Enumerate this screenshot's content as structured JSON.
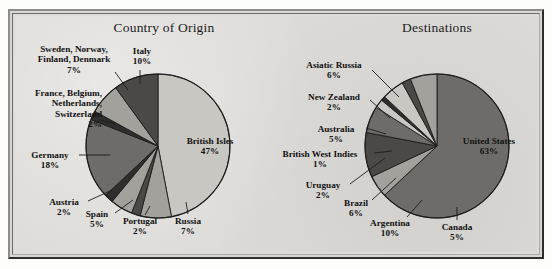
{
  "figure": {
    "background_color": "#dddbd7",
    "slice_colors": {
      "light": "#c9c7c2",
      "mid": "#a3a19c",
      "dark": "#6e6c68",
      "darker": "#4a4946",
      "darkest": "#2f2e2c",
      "outline": "#1c1c1a"
    }
  },
  "charts": [
    {
      "id": "country-of-origin",
      "title": "Country of Origin",
      "center": {
        "x": 158,
        "y": 146
      },
      "radius": 72,
      "start_angle_deg": -90,
      "slices": [
        {
          "label": "British Isles",
          "pct": 47,
          "pct_text": "47%",
          "fill": "light"
        },
        {
          "label": "Russia",
          "pct": 7,
          "pct_text": "7%",
          "fill": "mid"
        },
        {
          "label": "Portugal",
          "pct": 2,
          "pct_text": "2%",
          "fill": "darker"
        },
        {
          "label": "Spain",
          "pct": 5,
          "pct_text": "5%",
          "fill": "mid"
        },
        {
          "label": "Austria",
          "pct": 2,
          "pct_text": "2%",
          "fill": "darkest"
        },
        {
          "label": "Germany",
          "pct": 18,
          "pct_text": "18%",
          "fill": "dark"
        },
        {
          "label": "France, Belgium, Netherlands, Switzerland",
          "pct": 2,
          "pct_text": "2%",
          "fill": "darkest"
        },
        {
          "label": "Sweden, Norway, Finland, Denmark",
          "pct": 7,
          "pct_text": "7%",
          "fill": "mid"
        },
        {
          "label": "Italy",
          "pct": 10,
          "pct_text": "10%",
          "fill": "darker"
        }
      ],
      "callouts": [
        {
          "name": "sweden-norway-finland-denmark",
          "lines": [
            "Sweden, Norway,",
            "Finland, Denmark"
          ],
          "pct_text": "7%",
          "align": "center",
          "x": 22,
          "y": 44,
          "w": 104,
          "leader": [
            [
              115,
              72
            ],
            [
              128,
              90
            ]
          ]
        },
        {
          "name": "italy",
          "lines": [
            "Italy"
          ],
          "pct_text": "10%",
          "align": "center",
          "x": 122,
          "y": 46,
          "w": 40,
          "leader": [
            [
              140,
              70
            ],
            [
              140,
              84
            ]
          ]
        },
        {
          "name": "france-belgium-netherlands-switzerland",
          "lines": [
            "France, Belgium,",
            "Netherlands,",
            "Switzerland"
          ],
          "pct_text": "2%",
          "align": "right",
          "x": 10,
          "y": 88,
          "w": 92,
          "leader": [
            [
              101,
              120
            ],
            [
              116,
              124
            ]
          ]
        },
        {
          "name": "germany",
          "lines": [
            "Germany"
          ],
          "pct_text": "18%",
          "align": "center",
          "x": 22,
          "y": 150,
          "w": 56,
          "leader": [
            [
              79,
              155
            ],
            [
              110,
              155
            ]
          ]
        },
        {
          "name": "austria",
          "lines": [
            "Austria"
          ],
          "pct_text": "2%",
          "align": "center",
          "x": 42,
          "y": 197,
          "w": 44,
          "leader": [
            [
              88,
              201
            ],
            [
              112,
              190
            ]
          ]
        },
        {
          "name": "spain",
          "lines": [
            "Spain"
          ],
          "pct_text": "5%",
          "align": "center",
          "x": 78,
          "y": 209,
          "w": 38,
          "leader": [
            [
              115,
              213
            ],
            [
              133,
              200
            ]
          ]
        },
        {
          "name": "portugal",
          "lines": [
            "Portugal"
          ],
          "pct_text": "2%",
          "align": "center",
          "x": 115,
          "y": 216,
          "w": 50,
          "leader": [
            [
              145,
              215
            ],
            [
              150,
              206
            ]
          ]
        },
        {
          "name": "russia",
          "lines": [
            "Russia"
          ],
          "pct_text": "7%",
          "align": "center",
          "x": 166,
          "y": 216,
          "w": 44,
          "leader": [
            [
              188,
              214
            ],
            [
              186,
              202
            ]
          ]
        }
      ]
    },
    {
      "id": "destinations",
      "title": "Destinations",
      "center": {
        "x": 437,
        "y": 146
      },
      "radius": 72,
      "start_angle_deg": -90,
      "slices": [
        {
          "label": "United States",
          "pct": 63,
          "pct_text": "63%",
          "fill": "dark"
        },
        {
          "label": "Canada",
          "pct": 5,
          "pct_text": "5%",
          "fill": "mid"
        },
        {
          "label": "Argentina",
          "pct": 10,
          "pct_text": "10%",
          "fill": "darker"
        },
        {
          "label": "Brazil",
          "pct": 6,
          "pct_text": "6%",
          "fill": "dark"
        },
        {
          "label": "Uruguay",
          "pct": 2,
          "pct_text": "2%",
          "fill": "light"
        },
        {
          "label": "British West Indies",
          "pct": 1,
          "pct_text": "1%",
          "fill": "darkest"
        },
        {
          "label": "Australia",
          "pct": 5,
          "pct_text": "5%",
          "fill": "light"
        },
        {
          "label": "New Zealand",
          "pct": 2,
          "pct_text": "2%",
          "fill": "darker"
        },
        {
          "label": "Asiatic Russia",
          "pct": 6,
          "pct_text": "6%",
          "fill": "mid"
        }
      ],
      "callouts": [
        {
          "name": "asiatic-russia",
          "lines": [
            "Asiatic Russia"
          ],
          "pct_text": "6%",
          "align": "center",
          "x": 292,
          "y": 60,
          "w": 84,
          "leader": [
            [
              372,
              70
            ],
            [
              399,
              97
            ]
          ]
        },
        {
          "name": "new-zealand",
          "lines": [
            "New Zealand"
          ],
          "pct_text": "2%",
          "align": "center",
          "x": 294,
          "y": 92,
          "w": 80,
          "leader": [
            [
              370,
              100
            ],
            [
              390,
              118
            ]
          ]
        },
        {
          "name": "australia",
          "lines": [
            "Australia"
          ],
          "pct_text": "5%",
          "align": "center",
          "x": 308,
          "y": 124,
          "w": 56,
          "leader": [
            [
              366,
              128
            ],
            [
              386,
              134
            ]
          ]
        },
        {
          "name": "british-west-indies",
          "lines": [
            "British West Indies"
          ],
          "pct_text": "1%",
          "align": "center",
          "x": 268,
          "y": 149,
          "w": 104,
          "leader": [
            [
              374,
              153
            ],
            [
              392,
              151
            ]
          ]
        },
        {
          "name": "uruguay",
          "lines": [
            "Uruguay"
          ],
          "pct_text": "2%",
          "align": "center",
          "x": 296,
          "y": 180,
          "w": 54,
          "leader": [
            [
              350,
              184
            ],
            [
              385,
              158
            ]
          ]
        },
        {
          "name": "brazil",
          "lines": [
            "Brazil"
          ],
          "pct_text": "6%",
          "align": "center",
          "x": 334,
          "y": 198,
          "w": 44,
          "leader": [
            [
              372,
              200
            ],
            [
              396,
              178
            ]
          ]
        },
        {
          "name": "argentina",
          "lines": [
            "Argentina"
          ],
          "pct_text": "10%",
          "align": "center",
          "x": 360,
          "y": 218,
          "w": 60,
          "leader": [
            [
              407,
              217
            ],
            [
              422,
              200
            ]
          ]
        },
        {
          "name": "canada",
          "lines": [
            "Canada"
          ],
          "pct_text": "5%",
          "align": "center",
          "x": 432,
          "y": 222,
          "w": 50,
          "leader": [
            [
              457,
              220
            ],
            [
              457,
              207
            ]
          ]
        }
      ]
    }
  ],
  "chart_data": [
    {
      "type": "pie",
      "title": "Country of Origin",
      "labels": [
        "British Isles",
        "Russia",
        "Portugal",
        "Spain",
        "Austria",
        "Germany",
        "France, Belgium, Netherlands, Switzerland",
        "Sweden, Norway, Finland, Denmark",
        "Italy"
      ],
      "values": [
        47,
        7,
        2,
        5,
        2,
        18,
        2,
        7,
        10
      ],
      "units": "percent",
      "legend": "none (direct labels with leader lines)",
      "total": 100
    },
    {
      "type": "pie",
      "title": "Destinations",
      "labels": [
        "United States",
        "Canada",
        "Argentina",
        "Brazil",
        "Uruguay",
        "British West Indies",
        "Australia",
        "New Zealand",
        "Asiatic Russia"
      ],
      "values": [
        63,
        5,
        10,
        6,
        2,
        1,
        5,
        2,
        6
      ],
      "units": "percent",
      "legend": "none (direct labels with leader lines)",
      "total": 100
    }
  ]
}
